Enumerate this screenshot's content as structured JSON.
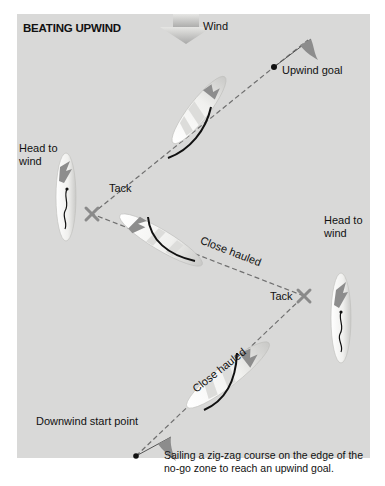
{
  "title": "BEATING UPWIND",
  "wind_label": "Wind",
  "upwind_goal_label": "Upwind goal",
  "head_to_wind_left": [
    "Head to",
    "wind"
  ],
  "head_to_wind_right": [
    "Head to",
    "wind"
  ],
  "tack_left_label": "Tack",
  "tack_right_label": "Tack",
  "close_hauled_upper": "Close hauled",
  "close_hauled_lower": "Close hauled",
  "downwind_start_label": "Downwind start point",
  "caption": [
    "Sailing a zig-zag course on the edge of the",
    "no-go zone to reach an upwind goal."
  ],
  "colors": {
    "background": "#d9d9d8",
    "course_line": "#6f6f6f",
    "tack_mark": "#8a8a8a",
    "flag": "#8c8c8c",
    "hull": "#f4f4f2",
    "sail_accent": "#9a9a9a",
    "text": "#111111"
  }
}
